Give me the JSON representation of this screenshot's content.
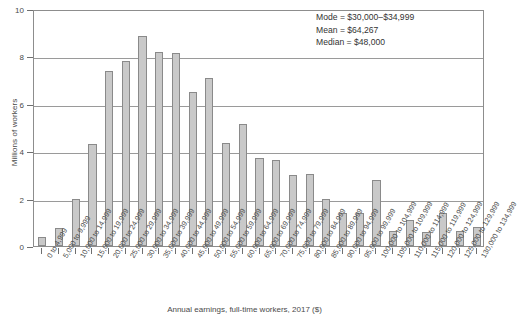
{
  "chart_data": {
    "type": "bar",
    "title": "",
    "xlabel": "Annual earnings, full-time workers, 2017 ($)",
    "ylabel": "Millions of workers",
    "ylim": [
      0,
      10
    ],
    "yticks": [
      0,
      2,
      4,
      6,
      8,
      10
    ],
    "ytick_labels": [
      "0",
      "2",
      "4",
      "6",
      "8",
      "10"
    ],
    "grid": "horizontal",
    "legend": "none",
    "categories": [
      "0 to 4,999",
      "5,000 to 9,999",
      "10,000 to 14,999",
      "15,000 to 19,999",
      "20,000 to 24,999",
      "25,000 to 29,999",
      "30,000 to 34,999",
      "35,000 to 39,999",
      "40,000 to 44,999",
      "45,000 to 49,999",
      "50,000 to 54,999",
      "55,000 to 59,999",
      "60,000 to 64,999",
      "65,000 to 69,999",
      "70,000 to 74,999",
      "75,000 to 79,999",
      "80,000 to 84,999",
      "85,000 to 89,999",
      "90,000 to 94,999",
      "95,000 to 99,999",
      "100,000 to 104,999",
      "105,000 to 109,999",
      "110,000 to 114,999",
      "115,000 to 119,999",
      "120,000 to 124,999",
      "125,000 to 129,999",
      "130,000 to 134,999"
    ],
    "values": [
      0.4,
      0.75,
      2.0,
      4.3,
      7.4,
      7.8,
      8.85,
      8.2,
      8.15,
      6.5,
      7.1,
      4.35,
      5.15,
      3.7,
      3.65,
      3.0,
      3.05,
      2.0,
      1.4,
      1.4,
      2.8,
      0.65,
      1.1,
      0.6,
      1.4,
      0.65,
      0.8
    ],
    "bar_color": "#c9c9c9",
    "bar_edge_color": "#8a8a8a"
  },
  "annotation": {
    "mode": "Mode = $30,000–$34,999",
    "mean": "Mean = $64,267",
    "median": "Median = $48,000"
  }
}
